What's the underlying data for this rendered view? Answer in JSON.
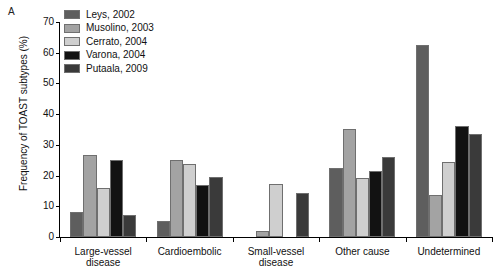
{
  "panel": {
    "label": "A"
  },
  "chart_data": {
    "type": "bar",
    "title": "",
    "xlabel": "",
    "ylabel": "Frequency of TOAST subtypes (%)",
    "ylim": [
      0,
      70
    ],
    "yticks": [
      0,
      10,
      20,
      30,
      40,
      50,
      60,
      70
    ],
    "grid": false,
    "legend_position": "top-left",
    "categories": [
      "Large-vessel disease",
      "Cardioembolic",
      "Small-vessel disease",
      "Other cause",
      "Undetermined"
    ],
    "series": [
      {
        "name": "Leys, 2002",
        "color": "#5e5e5e",
        "values": [
          8.0,
          5.3,
          0,
          22.4,
          62.5
        ]
      },
      {
        "name": "Musolino, 2003",
        "color": "#a3a3a3",
        "values": [
          26.6,
          25.0,
          1.8,
          35.3,
          13.8
        ]
      },
      {
        "name": "Cerrato, 2004",
        "color": "#cfcfcf",
        "values": [
          15.9,
          23.9,
          17.3,
          19.3,
          24.3
        ]
      },
      {
        "name": "Varona, 2004",
        "color": "#121212",
        "values": [
          25.1,
          17.0,
          0,
          21.5,
          36.2
        ]
      },
      {
        "name": "Putaala, 2009",
        "color": "#3a3a3a",
        "values": [
          7.2,
          19.6,
          14.2,
          26.1,
          33.4
        ]
      }
    ]
  }
}
